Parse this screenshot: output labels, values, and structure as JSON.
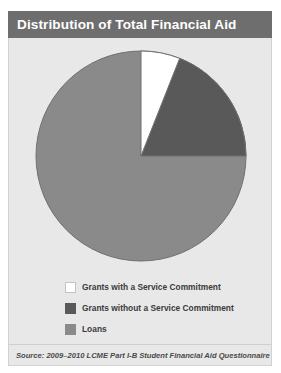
{
  "title": "Distribution of Total Financial Aid",
  "source": "Source: 2009–2010 LCME Part I-B Student Financial Aid Questionnaire",
  "colors": {
    "header_bg": "#6e6e6e",
    "header_text": "#ffffff",
    "panel_bg": "#e8e8e8",
    "grants_with_service": "#ffffff",
    "grants_without_service": "#595959",
    "loans": "#8a8a8a",
    "slice_outline": "#6f6f6f"
  },
  "legend": {
    "items": [
      {
        "label": "Grants with a Service Commitment",
        "color": "#ffffff",
        "swatch_name": "legend-swatch-grants-with-service"
      },
      {
        "label": "Grants without a Service Commitment",
        "color": "#595959",
        "swatch_name": "legend-swatch-grants-without-service"
      },
      {
        "label": "Loans",
        "color": "#8a8a8a",
        "swatch_name": "legend-swatch-loans"
      }
    ]
  },
  "chart_data": {
    "type": "pie",
    "title": "Distribution of Total Financial Aid",
    "labels": [
      "Grants with a Service Commitment",
      "Grants without a Service Commitment",
      "Loans"
    ],
    "values": [
      6,
      19,
      75
    ],
    "unit": "percent",
    "total": 100,
    "colors": [
      "#ffffff",
      "#595959",
      "#8a8a8a"
    ],
    "start_angle_deg": 0,
    "direction": "clockwise",
    "data_labels_shown": false,
    "legend_position": "bottom",
    "grid": false
  }
}
